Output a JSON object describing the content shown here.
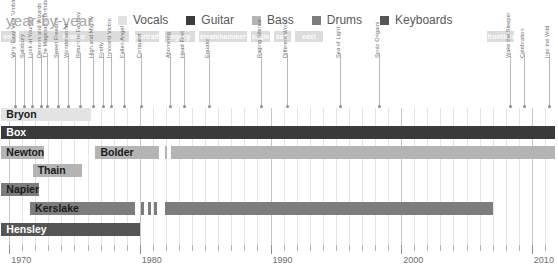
{
  "header": {
    "title": "year-by-year",
    "legend": [
      {
        "label": "Vocals",
        "color": "#e3e3e3"
      },
      {
        "label": "Guitar",
        "color": "#3a3a3a"
      },
      {
        "label": "Bass",
        "color": "#b4b4b4"
      },
      {
        "label": "Drums",
        "color": "#7d7d7d"
      },
      {
        "label": "Keyboards",
        "color": "#555555"
      }
    ]
  },
  "chart_data": {
    "type": "bar",
    "title": "year-by-year",
    "xlabel": "",
    "ylabel": "",
    "xlim": [
      1969.3,
      2012.0
    ],
    "grid": true,
    "legend_position": "top",
    "axis": {
      "tick_labels": [
        "1970",
        "1980",
        "1990",
        "2000",
        "2010"
      ],
      "tick_years": [
        1970,
        1980,
        1990,
        2000,
        2010
      ],
      "minor_step": 1
    },
    "categories": [
      "Bryon",
      "Box",
      "Newton",
      "Bolder",
      "Thain",
      "Napier",
      "Kerslake",
      "Hensley"
    ],
    "series": [
      {
        "name": "Bryon",
        "role": "Vocals",
        "color": "#e3e3e3",
        "spans": [
          [
            1969.4,
            1976.3
          ]
        ]
      },
      {
        "name": "Box",
        "role": "Guitar",
        "color": "#3a3a3a",
        "spans": [
          [
            1969.4,
            2011.8
          ]
        ]
      },
      {
        "name": "Newton",
        "role": "Bass",
        "color": "#b4b4b4",
        "spans": [
          [
            1969.4,
            1972.0
          ]
        ]
      },
      {
        "name": "Bolder",
        "role": "Bass",
        "color": "#b4b4b4",
        "spans": [
          [
            1976.6,
            1981.5
          ],
          [
            1981.9,
            1982.1
          ],
          [
            1982.4,
            2011.8
          ]
        ]
      },
      {
        "name": "Thain",
        "role": "Bass",
        "color": "#b4b4b4",
        "spans": [
          [
            1971.8,
            1975.6
          ]
        ]
      },
      {
        "name": "Napier",
        "role": "Drums",
        "color": "#7d7d7d",
        "spans": [
          [
            1969.4,
            1971.4
          ]
        ]
      },
      {
        "name": "Kerslake",
        "role": "Drums",
        "color": "#7d7d7d",
        "spans": [
          [
            1971.6,
            1979.6
          ],
          [
            1980.1,
            1980.35
          ],
          [
            1980.6,
            1980.85
          ],
          [
            1981.1,
            1981.35
          ],
          [
            1981.9,
            2007.0
          ]
        ]
      },
      {
        "name": "Hensley",
        "role": "Keyboards",
        "color": "#555555",
        "spans": [
          [
            1969.4,
            1980.0
          ]
        ]
      }
    ]
  },
  "albums_ribbon": [
    {
      "label": "ver",
      "start": 1969.4,
      "end": 1970.5
    },
    {
      "label": "bronze",
      "start": 1970.75,
      "end": 1979.2
    },
    {
      "label": "portrait",
      "start": 1979.6,
      "end": 1981.5
    },
    {
      "label": "legacy",
      "start": 1981.9,
      "end": 1984.2
    },
    {
      "label": "steamhammer",
      "start": 1984.5,
      "end": 1988.2
    },
    {
      "label": "eagle",
      "start": 1988.5,
      "end": 1990.0
    },
    {
      "label": "san.",
      "start": 1990.3,
      "end": 1991.6
    },
    {
      "label": "edel",
      "start": 1991.9,
      "end": 1994.0
    },
    {
      "label": "frontiers",
      "start": 2006.6,
      "end": 2008.6
    }
  ],
  "album_ticks": [
    {
      "label": "Very 'Eavy Very 'Umble",
      "year": 1970.45
    },
    {
      "label": "Salisbury",
      "year": 1971.15
    },
    {
      "label": "Look at Yourself",
      "year": 1971.75
    },
    {
      "label": "Demons and Wizards",
      "year": 1972.4
    },
    {
      "label": "The Magician's Birthday",
      "year": 1972.9
    },
    {
      "label": "Sweet Freedom",
      "year": 1973.75
    },
    {
      "label": "Wonderworld",
      "year": 1974.5
    },
    {
      "label": "Return to Fantasy",
      "year": 1975.4
    },
    {
      "label": "High and Mighty",
      "year": 1976.4
    },
    {
      "label": "Firefly",
      "year": 1977.15
    },
    {
      "label": "Innocent Victim",
      "year": 1977.8
    },
    {
      "label": "Fallen Angel",
      "year": 1978.8
    },
    {
      "label": "Conquest",
      "year": 1980.1
    },
    {
      "label": "Abominog",
      "year": 1982.3
    },
    {
      "label": "Head First",
      "year": 1983.4
    },
    {
      "label": "Equator",
      "year": 1985.3
    },
    {
      "label": "Raging Silence",
      "year": 1989.3
    },
    {
      "label": "Different World",
      "year": 1991.3
    },
    {
      "label": "Sea of Light",
      "year": 1995.3
    },
    {
      "label": "Sonic Origami",
      "year": 1998.3
    },
    {
      "label": "Wake the Sleeper",
      "year": 2008.3
    },
    {
      "label": "Celebration",
      "year": 2009.4
    },
    {
      "label": "Into the Wild",
      "year": 2011.3
    }
  ]
}
